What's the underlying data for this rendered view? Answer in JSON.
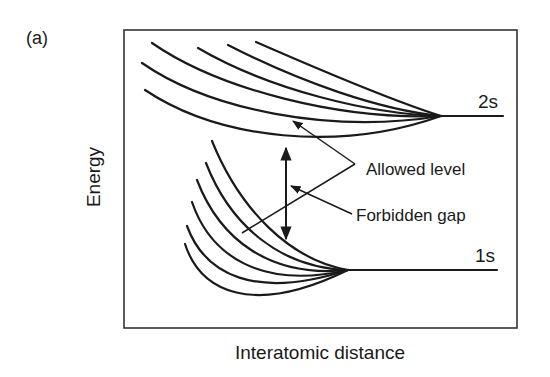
{
  "figure": {
    "panel_label": "(a)",
    "y_axis_label": "Energy",
    "x_axis_label": "Interatomic distance",
    "levels": [
      {
        "name": "2s",
        "label": "2s",
        "curve_count": 6
      },
      {
        "name": "1s",
        "label": "1s",
        "curve_count": 6
      }
    ],
    "annotations": {
      "allowed_level": "Allowed level",
      "forbidden_gap": "Forbidden gap"
    },
    "line_color": "#1a1a1a",
    "background_color": "#ffffff"
  }
}
